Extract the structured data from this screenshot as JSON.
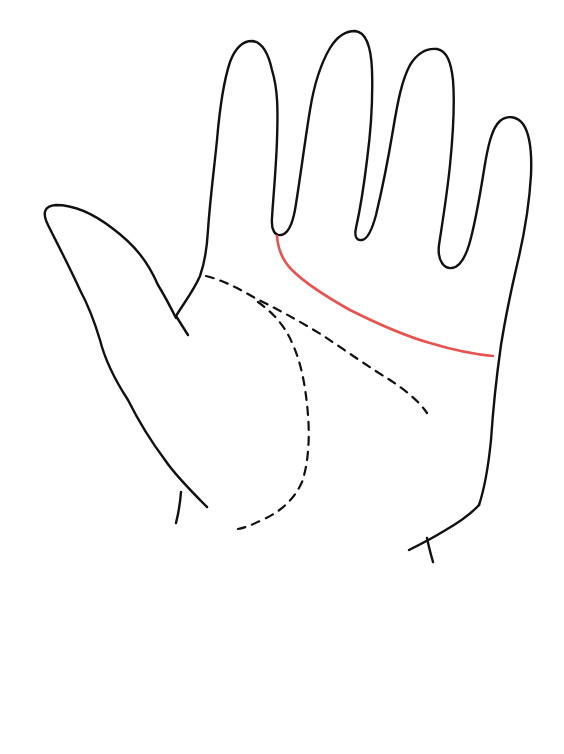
{
  "diagram": {
    "hand": "open palm outline",
    "highlighted_line": {
      "name": "heart line",
      "color": "#e8524f",
      "style": "solid"
    },
    "other_lines": [
      {
        "name": "head line",
        "style": "dashed",
        "color": "#111111"
      },
      {
        "name": "life line",
        "style": "dashed",
        "color": "#111111"
      }
    ],
    "outline_color": "#111111",
    "background": "#ffffff"
  }
}
